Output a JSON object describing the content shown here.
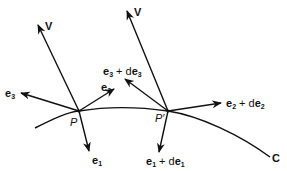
{
  "diagram": {
    "title": "",
    "curve": {
      "label": "C"
    },
    "points": [
      {
        "id": "P",
        "label": "P"
      },
      {
        "id": "P_prime",
        "label": "P′"
      }
    ],
    "vectors_at_P": {
      "v": "V",
      "e1": {
        "base": "e",
        "sub": "1"
      },
      "e2": {
        "base": "e",
        "sub": "2"
      },
      "e3": {
        "base": "e",
        "sub": "3"
      }
    },
    "vectors_at_P_prime": {
      "v": "V",
      "e1": {
        "base": "e",
        "sub": "1",
        "plus": " + d",
        "base2": "e",
        "sub2": "1"
      },
      "e2": {
        "base": "e",
        "sub": "2",
        "plus": " + d",
        "base2": "e",
        "sub2": "2"
      },
      "e3": {
        "base": "e",
        "sub": "3",
        "plus": " + d",
        "base2": "e",
        "sub2": "3"
      }
    }
  }
}
